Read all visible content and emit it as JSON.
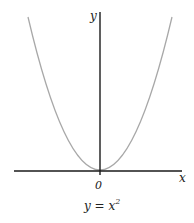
{
  "diagram": {
    "function": "y = x^2",
    "axes": {
      "x_label": "x",
      "y_label": "y",
      "origin_label": "0"
    },
    "caption": {
      "base": "y = x",
      "exponent": "2"
    },
    "colors": {
      "axis": "#1a1a1a",
      "curve": "#a8a8a8",
      "text": "#222222"
    }
  }
}
